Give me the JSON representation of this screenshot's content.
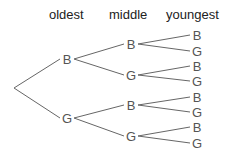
{
  "headers": {
    "oldest": "oldest",
    "middle": "middle",
    "youngest": "youngest"
  },
  "colors": {
    "line": "#666666",
    "text": "#555555",
    "header": "#222222"
  },
  "tree": {
    "root": {
      "x": 14,
      "y": 88
    },
    "oldest": [
      {
        "label": "B",
        "x": 67,
        "y": 59
      },
      {
        "label": "G",
        "x": 67,
        "y": 118
      }
    ],
    "middle": [
      {
        "label": "B",
        "x": 131,
        "y": 44
      },
      {
        "label": "G",
        "x": 131,
        "y": 75
      },
      {
        "label": "B",
        "x": 131,
        "y": 105
      },
      {
        "label": "G",
        "x": 131,
        "y": 136
      }
    ],
    "youngest": [
      {
        "label": "B",
        "x": 197,
        "y": 35
      },
      {
        "label": "G",
        "x": 197,
        "y": 51
      },
      {
        "label": "B",
        "x": 197,
        "y": 66
      },
      {
        "label": "G",
        "x": 197,
        "y": 81
      },
      {
        "label": "B",
        "x": 197,
        "y": 97
      },
      {
        "label": "G",
        "x": 197,
        "y": 112
      },
      {
        "label": "B",
        "x": 197,
        "y": 127
      },
      {
        "label": "G",
        "x": 197,
        "y": 143
      }
    ]
  }
}
